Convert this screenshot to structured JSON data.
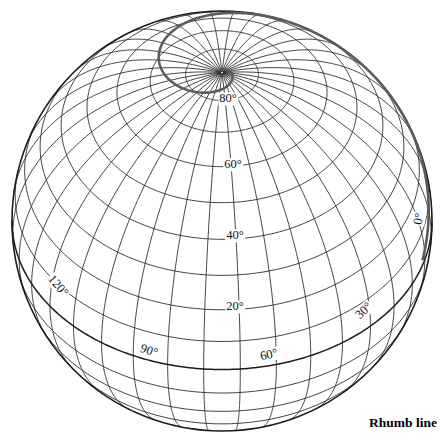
{
  "figure": {
    "background_color": "#ffffff",
    "line_color": "#2b2b2b",
    "rhumb_color": "#5c5c5c"
  },
  "caption": {
    "text": "Rhumb line",
    "x": 369,
    "y": 415
  },
  "chart_data": {
    "type": "map",
    "projection": "orthographic",
    "center": {
      "x": 222,
      "y": 221
    },
    "radius": 210,
    "view_center_lat": 45,
    "view_center_lon": 55,
    "graticule_spacing_deg": 10,
    "parallels_deg": [
      0,
      10,
      20,
      30,
      40,
      50,
      60,
      70,
      80
    ],
    "meridians_deg": [
      0,
      10,
      20,
      30,
      40,
      50,
      60,
      70,
      80,
      90,
      100,
      110,
      120,
      130,
      140,
      150,
      160,
      170
    ],
    "major_lines": [
      "equator"
    ],
    "rhumb_line": {
      "bearing_deg": 60,
      "start_lat": 2,
      "end_lat": 89.2,
      "start_lon": 128
    },
    "labels": [
      {
        "id": "lat-80",
        "text": "80°",
        "kind": "parallel",
        "value": 80,
        "x": 228,
        "y": 99,
        "rotation": 0
      },
      {
        "id": "lat-60",
        "text": "60°",
        "kind": "parallel",
        "value": 60,
        "x": 233,
        "y": 165,
        "rotation": 0
      },
      {
        "id": "lat-40",
        "text": "40°",
        "kind": "parallel",
        "value": 40,
        "x": 235,
        "y": 236,
        "rotation": 0
      },
      {
        "id": "lat-20",
        "text": "20°",
        "kind": "parallel",
        "value": 20,
        "x": 235,
        "y": 307,
        "rotation": 0
      },
      {
        "id": "lon-0",
        "text": "0°",
        "kind": "meridian",
        "value": 0,
        "x": 419,
        "y": 219,
        "rotation": -78
      },
      {
        "id": "lon-30",
        "text": "30°",
        "kind": "meridian",
        "value": 30,
        "x": 364,
        "y": 311,
        "rotation": -44
      },
      {
        "id": "lon-60",
        "text": "60°",
        "kind": "meridian",
        "value": 60,
        "x": 269,
        "y": 355,
        "rotation": -13
      },
      {
        "id": "lon-90",
        "text": "90°",
        "kind": "meridian",
        "value": 90,
        "x": 149,
        "y": 351,
        "rotation": 18
      },
      {
        "id": "lon-120",
        "text": "120°",
        "kind": "meridian",
        "value": 120,
        "x": 58,
        "y": 286,
        "rotation": 49
      }
    ]
  }
}
